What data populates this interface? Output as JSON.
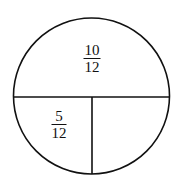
{
  "diagram": {
    "type": "circle-partition",
    "stroke_color": "#111111",
    "background": "#ffffff",
    "regions": [
      {
        "id": "top-half",
        "label": {
          "numerator": "10",
          "denominator": "12"
        }
      },
      {
        "id": "bottom-left-quarter",
        "label": {
          "numerator": "5",
          "denominator": "12"
        }
      },
      {
        "id": "bottom-right-quarter",
        "label": null
      }
    ]
  }
}
